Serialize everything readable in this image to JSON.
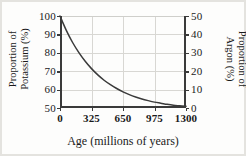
{
  "chart_data": {
    "type": "line",
    "title": "",
    "xlabel": "Age (millions of years)",
    "ylabel": "Proportion of Potassium (%)",
    "ylabel_secondary": "Proportion of Argon (%)",
    "xlim": [
      0,
      1300
    ],
    "ylim": [
      50,
      100
    ],
    "ylim_secondary": [
      50,
      0
    ],
    "grid": true,
    "legend": "none",
    "xticks": [
      0,
      325,
      650,
      975,
      1300
    ],
    "xticklabels": [
      "0",
      "325",
      "650",
      "975",
      "1300"
    ],
    "yticks": [
      50,
      60,
      70,
      80,
      90,
      100
    ],
    "yticklabels": [
      "50",
      "60",
      "70",
      "80",
      "90",
      "100"
    ],
    "yticks_secondary": [
      0,
      10,
      20,
      30,
      40,
      50
    ],
    "yticklabels_secondary": [
      "0",
      "10",
      "20",
      "30",
      "40",
      "50"
    ],
    "series": [
      {
        "name": "Proportion of Potassium",
        "x": [
          0,
          65,
          130,
          195,
          260,
          325,
          390,
          455,
          520,
          585,
          650,
          715,
          780,
          845,
          910,
          975,
          1040,
          1105,
          1170,
          1235,
          1300
        ],
        "values": [
          100.0,
          92.2,
          85.6,
          80.1,
          75.4,
          71.4,
          68.0,
          65.1,
          62.7,
          60.6,
          58.8,
          57.3,
          56.0,
          54.9,
          54.0,
          53.2,
          52.6,
          52.0,
          51.5,
          51.2,
          50.9
        ]
      }
    ],
    "curve_color": "#3a3a3a",
    "grid_color": "#d8d7d3",
    "axis_color": "#3a3a3a"
  },
  "axis_titles": {
    "left_line1": "Proportion of",
    "left_line2": "Potassium (%)",
    "right_line1": "Proportion of",
    "right_line2": "Argon (%)",
    "bottom": "Age (millions of years)"
  }
}
